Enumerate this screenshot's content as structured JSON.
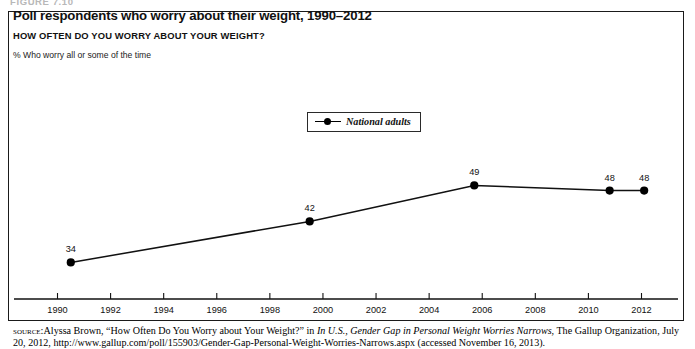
{
  "figure": {
    "number_label": "FIGURE 7.10"
  },
  "header": {
    "title": "Poll respondents who worry about their weight, 1990–2012",
    "subtitle": "HOW OFTEN DO YOU WORRY ABOUT YOUR WEIGHT?",
    "note": "% Who worry all or some of the time"
  },
  "legend": {
    "position": "inside-top-center",
    "entries": [
      {
        "label": "National adults",
        "color": "#000000",
        "marker": "circle"
      }
    ]
  },
  "source": {
    "label": "source:",
    "text_part1": "Alyssa Brown, “How Often Do You Worry about Your Weight?” in ",
    "italic1": "In U.S., Gender Gap in Personal Weight Worries Narrows",
    "text_part2": ", The Gallup Organization, July 20, 2012, http://www.gallup.com/poll/155903/Gender-Gap-Personal-Weight-Worries-Narrows.aspx (accessed November 16, 2013)."
  },
  "chart_data": {
    "type": "line",
    "title": "Poll respondents who worry about their weight, 1990–2012",
    "subtitle": "HOW OFTEN DO YOU WORRY ABOUT YOUR WEIGHT?",
    "ylabel": "% Who worry all or some of the time",
    "xlabel": "",
    "xlim": [
      1989.0,
      2013.0
    ],
    "ylim": [
      0,
      60
    ],
    "grid": false,
    "legend_position": "top-center",
    "xticks": [
      1990,
      1992,
      1994,
      1996,
      1998,
      2000,
      2002,
      2004,
      2006,
      2008,
      2010,
      2012
    ],
    "xtick_labels": [
      "1990",
      "1992",
      "1994",
      "1996",
      "1998",
      "2000",
      "2002",
      "2004",
      "2006",
      "2008",
      "2010",
      "2012"
    ],
    "yticks": [],
    "ytick_labels": [],
    "series": [
      {
        "name": "National adults",
        "color": "#000000",
        "x": [
          1990.5,
          1999.5,
          2005.7,
          2010.8,
          2012.1
        ],
        "values": [
          34,
          42,
          49,
          48,
          48
        ],
        "point_labels": [
          "34",
          "42",
          "49",
          "48",
          "48"
        ]
      }
    ]
  }
}
